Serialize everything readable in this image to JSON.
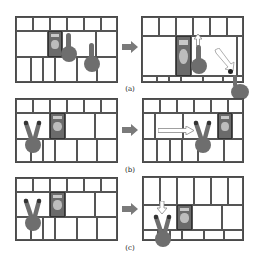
{
  "figure": {
    "panels": [
      {
        "id": "a",
        "caption": "(a)",
        "description": "Two-finger gesture: one finger holds the item, another drags toward the corner to scroll/resize the grid",
        "before": {
          "gesture": "one-finger-hold-plus-second-finger"
        },
        "after": {
          "gesture": "hold-and-drag-to-corner",
          "indicators": [
            "up-arrow",
            "diagonal-arrow",
            "corner-dot"
          ]
        }
      },
      {
        "id": "b",
        "caption": "(b)",
        "description": "Two-finger drag moves the item horizontally to the right",
        "before": {
          "gesture": "two-finger-touch"
        },
        "after": {
          "gesture": "two-finger-drag-right",
          "indicators": [
            "right-arrow"
          ]
        }
      },
      {
        "id": "c",
        "caption": "(c)",
        "description": "Two-finger drag downward moves the row/item down",
        "before": {
          "gesture": "two-finger-touch"
        },
        "after": {
          "gesture": "two-finger-drag-down",
          "indicators": [
            "down-arrow"
          ]
        }
      }
    ],
    "transition_arrow": "right-arrow",
    "colors": {
      "grid_line": "#4a4a4a",
      "hand": "#6e6e6e",
      "arrow": "#7a7a7a",
      "poster": "#6b6b6b",
      "background": "#ffffff"
    }
  }
}
